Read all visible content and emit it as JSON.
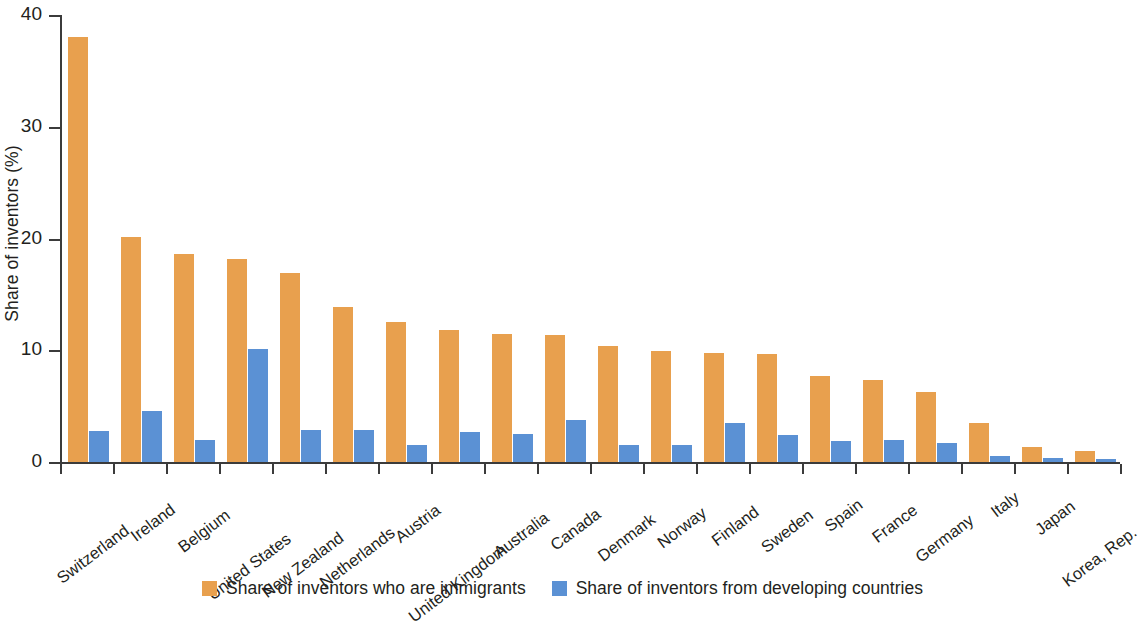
{
  "chart_data": {
    "type": "bar",
    "title": "",
    "xlabel": "",
    "ylabel": "Share of inventors (%)",
    "ylim": [
      0,
      40
    ],
    "yticks": [
      0,
      10,
      20,
      30,
      40
    ],
    "ytick_labels": [
      "0",
      "10",
      "20",
      "30",
      "40"
    ],
    "grid": false,
    "legend_position": "bottom-center",
    "categories": [
      "Switzerland",
      "Ireland",
      "Belgium",
      "United States",
      "New Zealand",
      "Netherlands",
      "Austria",
      "United Kingdom",
      "Australia",
      "Canada",
      "Denmark",
      "Norway",
      "Finland",
      "Sweden",
      "Spain",
      "France",
      "Germany",
      "Italy",
      "Japan",
      "Korea, Rep."
    ],
    "series": [
      {
        "name": "Share of inventors who are immigrants",
        "color": "#e8a04e",
        "values": [
          38.0,
          20.1,
          18.6,
          18.2,
          16.9,
          13.9,
          12.5,
          11.8,
          11.5,
          11.4,
          10.4,
          9.9,
          9.8,
          9.7,
          7.7,
          7.3,
          6.3,
          3.5,
          1.3,
          1.0
        ]
      },
      {
        "name": "Share of inventors from developing countries",
        "color": "#5b91d4",
        "values": [
          2.8,
          4.6,
          2.0,
          10.1,
          2.9,
          2.9,
          1.5,
          2.7,
          2.5,
          3.8,
          1.5,
          1.5,
          3.5,
          2.4,
          1.9,
          2.0,
          1.7,
          0.5,
          0.4,
          0.3
        ]
      }
    ]
  },
  "legend": {
    "items": [
      {
        "label": "Share of inventors who are immigrants",
        "color": "#e8a04e"
      },
      {
        "label": "Share of inventors from developing countries",
        "color": "#5b91d4"
      }
    ]
  },
  "axis": {
    "y_title": "Share of inventors (%)"
  }
}
